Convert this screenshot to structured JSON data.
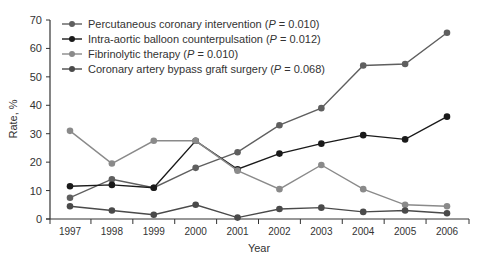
{
  "chart_data": {
    "type": "line",
    "title": "",
    "xlabel": "Year",
    "ylabel": "Rate, %",
    "ylim": [
      0,
      70
    ],
    "yticks": [
      0,
      10,
      20,
      30,
      40,
      50,
      60,
      70
    ],
    "grid": false,
    "legend_position": "top-left",
    "x": [
      "1997",
      "1998",
      "1999",
      "2000",
      "2001",
      "2002",
      "2003",
      "2004",
      "2005",
      "2006"
    ],
    "series": [
      {
        "name": "Percutaneous coronary intervention",
        "p_value": "P = 0.010",
        "color": "#5f5f5f",
        "values": [
          7.5,
          14,
          11,
          18,
          23.5,
          33,
          39,
          54,
          54.5,
          65.5
        ]
      },
      {
        "name": "Intra-aortic balloon counterpulsation",
        "p_value": "P = 0.012",
        "color": "#1a1a1a",
        "values": [
          11.5,
          12,
          11,
          27.5,
          17.5,
          23,
          26.5,
          29.5,
          28,
          36
        ]
      },
      {
        "name": "Fibrinolytic therapy",
        "p_value": "P = 0.010",
        "color": "#8a8a8a",
        "values": [
          31,
          19.5,
          27.5,
          27.5,
          17,
          10.5,
          19,
          10.5,
          5,
          4.5
        ]
      },
      {
        "name": "Coronary artery bypass graft surgery",
        "p_value": "P = 0.068",
        "color": "#4a4a4a",
        "values": [
          4.5,
          3,
          1.5,
          5,
          0.5,
          3.5,
          4,
          2.5,
          3,
          2
        ]
      }
    ]
  }
}
